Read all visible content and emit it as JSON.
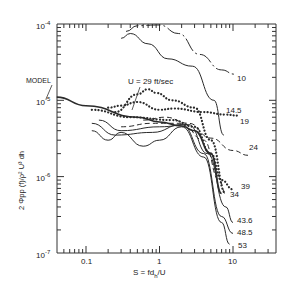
{
  "chart_data": {
    "type": "line",
    "title": "",
    "xlabel": "S = fd_h/U",
    "ylabel": "2 Φpp(f) / ρ² U³ dh",
    "xscale": "log",
    "yscale": "log",
    "xlim": [
      0.04,
      50
    ],
    "ylim": [
      1e-07,
      0.0001
    ],
    "x_tick_labels": [
      "0.1",
      "1",
      "10"
    ],
    "y_tick_labels": [
      "10^-4",
      "10^-5",
      "10^-6",
      "10^-7"
    ],
    "grid": false,
    "annotations": [
      "MODEL",
      "U = 29 ft/sec"
    ],
    "series": [
      {
        "name": "MODEL",
        "style": "solid-thick",
        "points": [
          [
            0.04,
            1.1e-05
          ],
          [
            0.1,
            8.5e-06
          ],
          [
            0.5,
            6e-06
          ],
          [
            1.0,
            5.2e-06
          ],
          [
            2.0,
            4.6e-06
          ],
          [
            3.0,
            4e-06
          ],
          [
            5.0,
            2e-06
          ],
          [
            7.0,
            6e-07
          ]
        ]
      },
      {
        "name": "10",
        "style": "dash-dot",
        "points": [
          [
            0.35,
            8e-05
          ],
          [
            0.5,
            9.5e-05
          ],
          [
            1.0,
            9.7e-05
          ],
          [
            1.8,
            7.5e-05
          ],
          [
            3.5,
            4e-05
          ],
          [
            7.0,
            2.5e-05
          ],
          [
            10.5,
            2.2e-05
          ]
        ]
      },
      {
        "name": "14.5",
        "style": "solid",
        "points": [
          [
            0.3,
            6.5e-05
          ],
          [
            0.4,
            7.5e-05
          ],
          [
            0.7,
            5.5e-05
          ],
          [
            1.3,
            3.5e-05
          ],
          [
            2.8,
            2.8e-05
          ],
          [
            5.5,
            1e-05
          ],
          [
            7.5,
            3.5e-06
          ]
        ]
      },
      {
        "name": "19",
        "style": "dotted",
        "points": [
          [
            0.2,
            8e-06
          ],
          [
            0.3,
            8.5e-06
          ],
          [
            0.5,
            9.5e-06
          ],
          [
            1.0,
            7.5e-06
          ],
          [
            1.6,
            7.8e-06
          ],
          [
            4.0,
            7e-06
          ],
          [
            8.0,
            6.5e-06
          ],
          [
            12.0,
            6.3e-06
          ]
        ]
      },
      {
        "name": "29",
        "style": "dotted",
        "points": [
          [
            0.25,
            7e-06
          ],
          [
            0.5,
            1.2e-05
          ],
          [
            0.7,
            1.4e-05
          ],
          [
            0.9,
            1.25e-05
          ],
          [
            1.5,
            1e-05
          ],
          [
            3.0,
            8e-06
          ],
          [
            5.0,
            3e-06
          ],
          [
            8.0,
            6e-07
          ]
        ]
      },
      {
        "name": "24",
        "style": "dashed",
        "points": [
          [
            0.6,
            5.5e-06
          ],
          [
            1.2,
            6e-06
          ],
          [
            2.5,
            5e-06
          ],
          [
            5.0,
            3.2e-06
          ],
          [
            10.0,
            2.2e-06
          ],
          [
            16.0,
            1.9e-06
          ]
        ]
      },
      {
        "name": "39",
        "style": "dotted",
        "points": [
          [
            0.12,
            7.5e-06
          ],
          [
            0.4,
            6e-06
          ],
          [
            1.5,
            5.5e-06
          ],
          [
            3.0,
            4.5e-06
          ],
          [
            5.0,
            2e-06
          ],
          [
            7.0,
            9e-07
          ],
          [
            10.0,
            6.8e-07
          ]
        ]
      },
      {
        "name": "34",
        "style": "dashed",
        "points": [
          [
            0.3,
            4.5e-06
          ],
          [
            0.8,
            5e-06
          ],
          [
            2.0,
            5e-06
          ],
          [
            4.0,
            3e-06
          ],
          [
            6.5,
            9e-07
          ],
          [
            8.0,
            5.8e-07
          ]
        ]
      },
      {
        "name": "43.6",
        "style": "solid",
        "points": [
          [
            0.15,
            5.5e-06
          ],
          [
            0.3,
            4e-06
          ],
          [
            1.0,
            4.5e-06
          ],
          [
            2.5,
            4.8e-06
          ],
          [
            4.5,
            2e-06
          ],
          [
            8.0,
            4e-07
          ],
          [
            10.0,
            2.5e-07
          ]
        ]
      },
      {
        "name": "48.5",
        "style": "solid",
        "points": [
          [
            0.12,
            5e-06
          ],
          [
            0.25,
            3.5e-06
          ],
          [
            0.8,
            3.8e-06
          ],
          [
            2.0,
            4.8e-06
          ],
          [
            4.0,
            2e-06
          ],
          [
            7.0,
            3e-07
          ],
          [
            10.0,
            1.8e-07
          ]
        ]
      },
      {
        "name": "53",
        "style": "solid",
        "points": [
          [
            0.12,
            4e-06
          ],
          [
            0.2,
            3e-06
          ],
          [
            0.3,
            3.8e-06
          ],
          [
            0.6,
            2.5e-06
          ],
          [
            1.0,
            3e-06
          ],
          [
            2.0,
            4.5e-06
          ],
          [
            4.0,
            1.8e-06
          ],
          [
            7.0,
            2.5e-07
          ],
          [
            9.0,
            1.3e-07
          ]
        ]
      }
    ],
    "curve_labels": [
      {
        "text": "10",
        "x": 237,
        "y": 81
      },
      {
        "text": "14.5",
        "x": 226,
        "y": 113
      },
      {
        "text": "19",
        "x": 240,
        "y": 124
      },
      {
        "text": "24",
        "x": 249,
        "y": 150
      },
      {
        "text": "39",
        "x": 241,
        "y": 189
      },
      {
        "text": "34",
        "x": 230,
        "y": 197
      },
      {
        "text": "43.6",
        "x": 237,
        "y": 223
      },
      {
        "text": "48.5",
        "x": 237,
        "y": 235
      },
      {
        "text": "53",
        "x": 238,
        "y": 248
      }
    ],
    "annotation_text": {
      "model": "MODEL",
      "speed": "U = 29 ft/sec"
    }
  },
  "axes": {
    "y_labels": [
      {
        "base": "10",
        "exp": "-4"
      },
      {
        "base": "10",
        "exp": "-5"
      },
      {
        "base": "10",
        "exp": "-6"
      },
      {
        "base": "10",
        "exp": "-7"
      }
    ],
    "x_labels": [
      "0.1",
      "1",
      "10"
    ],
    "xlabel_main": "S = fd",
    "xlabel_sub": "h",
    "xlabel_tail": "/U",
    "ylabel": "2 Φpp (f)/ρ² U³ dh"
  }
}
